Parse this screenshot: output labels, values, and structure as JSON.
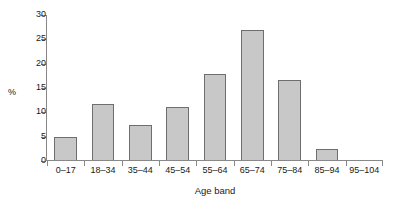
{
  "chart_data": {
    "type": "bar",
    "title": "",
    "subtitle": "",
    "xlabel": "Age band",
    "ylabel": "%",
    "categories": [
      "0–17",
      "18–34",
      "35–44",
      "45–54",
      "55–64",
      "65–74",
      "75–84",
      "85–94",
      "95–104"
    ],
    "values": [
      5.0,
      11.7,
      7.4,
      11.2,
      17.8,
      27.0,
      16.7,
      2.4,
      0
    ],
    "ylim": [
      0,
      30
    ],
    "ytick_values": [
      0,
      5,
      10,
      15,
      20,
      25,
      30
    ],
    "ytick_labels": [
      "0",
      "5",
      "10",
      "15",
      "20",
      "25",
      "30"
    ],
    "grid": false,
    "legend": null,
    "legend_position": "none",
    "annotations": [],
    "colors": {
      "bar_fill": "#c8c8c8",
      "bar_stroke": "#6e6e6e",
      "axis": "#888888",
      "text": "#1a1a1a",
      "background": "#ffffff"
    }
  }
}
